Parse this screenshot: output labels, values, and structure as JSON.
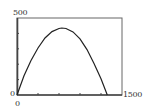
{
  "chart_data": {
    "type": "line",
    "title": "",
    "xlabel": "",
    "ylabel": "",
    "xlim": [
      0,
      1500
    ],
    "ylim": [
      0,
      500
    ],
    "x_tick_labels": [
      "0",
      "1500"
    ],
    "y_tick_labels": [
      "0",
      "500"
    ],
    "x_ticks": [
      0,
      300,
      600,
      900,
      1200,
      1500
    ],
    "y_ticks": [
      0,
      100,
      200,
      300,
      400,
      500
    ],
    "grid": false,
    "legend": null,
    "series": [
      {
        "name": "curve",
        "x": [
          0,
          100,
          200,
          300,
          400,
          500,
          600,
          640,
          700,
          800,
          900,
          1000,
          1100,
          1200,
          1290
        ],
        "y": [
          0,
          125,
          225,
          305,
          370,
          412,
          432,
          435,
          432,
          410,
          365,
          295,
          205,
          105,
          0
        ]
      }
    ]
  },
  "labels": {
    "y_max": "500",
    "y_min": "0",
    "x_min": "0",
    "x_max": "1500"
  },
  "colors": {
    "frame": "#555555",
    "curve": "#222222",
    "text": "#333333"
  }
}
